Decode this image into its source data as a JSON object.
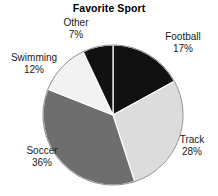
{
  "chart_data": {
    "type": "pie",
    "title": "Favorite Sport",
    "xlabel": "",
    "ylabel": "",
    "legend_position": "none",
    "grid": false,
    "labels": [
      "Football",
      "Track",
      "Soccer",
      "Swimming",
      "Other"
    ],
    "values": [
      17,
      28,
      36,
      12,
      7
    ],
    "value_suffix": "%",
    "start_angle_deg": 0,
    "direction": "clockwise",
    "slices": [
      {
        "label": "Football",
        "value": 17,
        "value_text": "17%",
        "color": "#111111"
      },
      {
        "label": "Track",
        "value": 28,
        "value_text": "28%",
        "color": "#dcdcdc"
      },
      {
        "label": "Soccer",
        "value": 36,
        "value_text": "36%",
        "color": "#6e6e6e"
      },
      {
        "label": "Swimming",
        "value": 12,
        "value_text": "12%",
        "color": "#f2f2f2"
      },
      {
        "label": "Other",
        "value": 7,
        "value_text": "7%",
        "color": "#111111"
      }
    ],
    "colors": {
      "background": "#ffffff",
      "text": "#1a1a1a",
      "outline": "#8a8a8a",
      "separator": "#ffffff"
    },
    "geometry": {
      "cx": 113,
      "cy": 115,
      "r": 70
    }
  }
}
